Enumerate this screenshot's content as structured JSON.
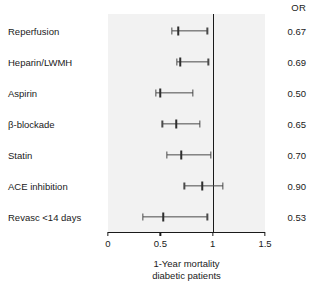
{
  "figure": {
    "or_column_header": "OR",
    "axis_caption_line1": "1-Year mortality",
    "axis_caption_line2": "diabetic patients"
  },
  "chart_data": {
    "type": "forest",
    "title": "",
    "subtitle": "",
    "xlabel": "1-Year mortality diabetic patients",
    "ylabel": "",
    "xlim": [
      0,
      1.5
    ],
    "xticks": [
      0,
      0.5,
      1,
      1.5
    ],
    "xtick_labels": [
      "0",
      "0.5",
      "1",
      "1.5"
    ],
    "reference_line": 1,
    "grid": false,
    "legend": null,
    "value_column_header": "OR",
    "categories": [
      "Reperfusion",
      "Heparin/LWMH",
      "Aspirin",
      "β-blockade",
      "Statin",
      "ACE inhibition",
      "Revasc <14 days"
    ],
    "values": [
      0.67,
      0.69,
      0.5,
      0.65,
      0.7,
      0.9,
      0.53
    ],
    "value_labels": [
      "0.67",
      "0.69",
      "0.50",
      "0.65",
      "0.70",
      "0.90",
      "0.53"
    ],
    "ci_low": [
      0.61,
      0.66,
      0.46,
      0.52,
      0.56,
      0.73,
      0.33
    ],
    "ci_high": [
      0.95,
      0.96,
      0.81,
      0.88,
      0.98,
      1.1,
      0.95
    ],
    "rows": [
      {
        "label": "Reperfusion",
        "or": "0.67",
        "point": 0.67,
        "low": 0.61,
        "high": 0.95
      },
      {
        "label": "Heparin/LWMH",
        "or": "0.69",
        "point": 0.69,
        "low": 0.66,
        "high": 0.96
      },
      {
        "label": "Aspirin",
        "or": "0.50",
        "point": 0.5,
        "low": 0.46,
        "high": 0.81
      },
      {
        "label": "β-blockade",
        "or": "0.65",
        "point": 0.65,
        "low": 0.52,
        "high": 0.88
      },
      {
        "label": "Statin",
        "or": "0.70",
        "point": 0.7,
        "low": 0.56,
        "high": 0.98
      },
      {
        "label": "ACE inhibition",
        "or": "0.90",
        "point": 0.9,
        "low": 0.73,
        "high": 1.1
      },
      {
        "label": "Revasc <14 days",
        "or": "0.53",
        "point": 0.53,
        "low": 0.33,
        "high": 0.95
      }
    ]
  },
  "colors": {
    "panel_background": "#f2f2f2",
    "text": "#1a1a1a",
    "reference_line": "#1a1a1a",
    "interval": "#4a4a4a",
    "point_estimate": "#2e2e2e"
  }
}
